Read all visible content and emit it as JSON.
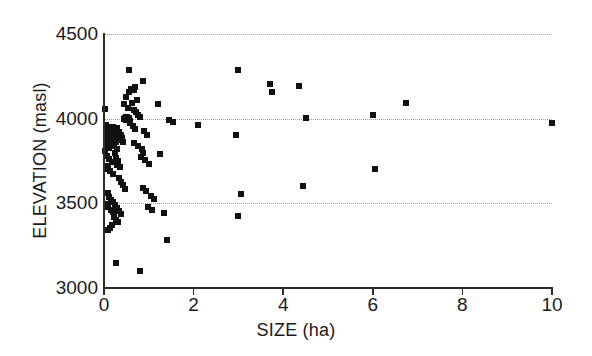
{
  "chart_data": {
    "type": "scatter",
    "title": "",
    "xlabel": "SIZE (ha)",
    "ylabel": "ELEVATION (masl)",
    "xlim": [
      0,
      10
    ],
    "ylim": [
      3000,
      4500
    ],
    "xticks": [
      0,
      2,
      4,
      6,
      8,
      10
    ],
    "xtick_labels": [
      "0",
      "2",
      "4",
      "6",
      "8",
      "10"
    ],
    "yticks": [
      3000,
      3500,
      4000,
      4500
    ],
    "ytick_labels": [
      "3000",
      "3500",
      "4000",
      "4500"
    ],
    "grid": "horizontal-dotted",
    "gridlines_y": [
      3500,
      4000,
      4500
    ],
    "legend": "none",
    "marker": "filled-square",
    "marker_color": "#111111",
    "n_points": 118,
    "points": [
      [
        0.02,
        4058
      ],
      [
        0.05,
        3962
      ],
      [
        0.06,
        3938
      ],
      [
        0.07,
        3915
      ],
      [
        0.08,
        3892
      ],
      [
        0.04,
        3872
      ],
      [
        0.1,
        3952
      ],
      [
        0.12,
        3930
      ],
      [
        0.09,
        3905
      ],
      [
        0.13,
        3885
      ],
      [
        0.05,
        3845
      ],
      [
        0.11,
        3826
      ],
      [
        0.03,
        3808
      ],
      [
        0.14,
        3862
      ],
      [
        0.16,
        3938
      ],
      [
        0.18,
        3918
      ],
      [
        0.15,
        3895
      ],
      [
        0.2,
        3948
      ],
      [
        0.07,
        3782
      ],
      [
        0.12,
        3762
      ],
      [
        0.17,
        3745
      ],
      [
        0.09,
        3722
      ],
      [
        0.04,
        3700
      ],
      [
        0.14,
        3688
      ],
      [
        0.19,
        3672
      ],
      [
        0.22,
        3928
      ],
      [
        0.24,
        3900
      ],
      [
        0.21,
        3878
      ],
      [
        0.26,
        3860
      ],
      [
        0.23,
        3840
      ],
      [
        0.28,
        3822
      ],
      [
        0.25,
        3800
      ],
      [
        0.3,
        3945
      ],
      [
        0.33,
        3922
      ],
      [
        0.31,
        3898
      ],
      [
        0.35,
        3875
      ],
      [
        0.27,
        3768
      ],
      [
        0.32,
        3748
      ],
      [
        0.29,
        3728
      ],
      [
        0.36,
        3712
      ],
      [
        0.38,
        3905
      ],
      [
        0.4,
        3885
      ],
      [
        0.42,
        3862
      ],
      [
        0.44,
        3998
      ],
      [
        0.46,
        4005
      ],
      [
        0.48,
        4012
      ],
      [
        0.5,
        3995
      ],
      [
        0.52,
        4008
      ],
      [
        0.55,
        4002
      ],
      [
        0.58,
        3985
      ],
      [
        0.34,
        3648
      ],
      [
        0.39,
        3628
      ],
      [
        0.43,
        3608
      ],
      [
        0.47,
        3585
      ],
      [
        0.08,
        3560
      ],
      [
        0.12,
        3540
      ],
      [
        0.16,
        3522
      ],
      [
        0.2,
        3505
      ],
      [
        0.06,
        3495
      ],
      [
        0.1,
        3478
      ],
      [
        0.15,
        3462
      ],
      [
        0.19,
        3448
      ],
      [
        0.24,
        3492
      ],
      [
        0.28,
        3472
      ],
      [
        0.33,
        3455
      ],
      [
        0.37,
        3438
      ],
      [
        0.22,
        3418
      ],
      [
        0.27,
        3402
      ],
      [
        0.31,
        3388
      ],
      [
        0.18,
        3372
      ],
      [
        0.13,
        3355
      ],
      [
        0.09,
        3340
      ],
      [
        0.26,
        3145
      ],
      [
        0.8,
        3098
      ],
      [
        0.6,
        4175
      ],
      [
        0.63,
        4172
      ],
      [
        0.66,
        4168
      ],
      [
        0.56,
        4160
      ],
      [
        0.7,
        4185
      ],
      [
        0.74,
        4108
      ],
      [
        0.62,
        4095
      ],
      [
        0.45,
        4085
      ],
      [
        0.5,
        4130
      ],
      [
        0.54,
        4065
      ],
      [
        0.68,
        4050
      ],
      [
        0.72,
        4040
      ],
      [
        0.76,
        4020
      ],
      [
        0.8,
        4008
      ],
      [
        0.58,
        3975
      ],
      [
        0.64,
        3958
      ],
      [
        0.7,
        3940
      ],
      [
        0.66,
        3855
      ],
      [
        0.75,
        3838
      ],
      [
        0.84,
        3818
      ],
      [
        0.9,
        3925
      ],
      [
        0.95,
        3905
      ],
      [
        0.88,
        3795
      ],
      [
        0.82,
        3775
      ],
      [
        0.92,
        3755
      ],
      [
        1.0,
        3735
      ],
      [
        0.86,
        3588
      ],
      [
        0.94,
        3572
      ],
      [
        1.05,
        3545
      ],
      [
        1.12,
        3528
      ],
      [
        0.98,
        3478
      ],
      [
        1.08,
        3458
      ],
      [
        0.55,
        4285
      ],
      [
        0.88,
        4225
      ],
      [
        1.2,
        4085
      ],
      [
        1.25,
        3790
      ],
      [
        1.45,
        3995
      ],
      [
        1.55,
        3982
      ],
      [
        1.35,
        3445
      ],
      [
        1.4,
        3285
      ],
      [
        2.1,
        3965
      ],
      [
        3.0,
        4290
      ],
      [
        2.95,
        3905
      ],
      [
        3.05,
        3555
      ],
      [
        3.0,
        3425
      ],
      [
        3.7,
        4205
      ],
      [
        3.75,
        4158
      ],
      [
        4.35,
        4190
      ],
      [
        4.5,
        4005
      ],
      [
        4.45,
        3605
      ],
      [
        6.0,
        4020
      ],
      [
        6.05,
        3700
      ],
      [
        6.75,
        4090
      ],
      [
        10.0,
        3972
      ]
    ]
  },
  "axes": {
    "x_title": "SIZE (ha)",
    "y_title": "ELEVATION (masl)",
    "x_tick_labels": [
      "0",
      "2",
      "4",
      "6",
      "8",
      "10"
    ],
    "y_tick_labels": [
      "3000",
      "3500",
      "4000",
      "4500"
    ]
  }
}
